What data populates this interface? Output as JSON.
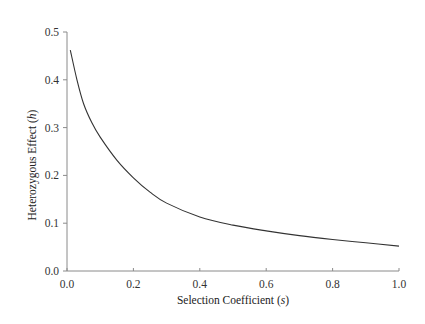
{
  "chart_data": {
    "type": "line",
    "title": "",
    "xlabel": "Selection Coefficient (s)",
    "xlabel_parts": {
      "main": "Selection Coefficient (",
      "var": "s",
      "end": ")"
    },
    "ylabel": "Heterozygous Effect (h)",
    "ylabel_parts": {
      "main": "Heterozygous Effect (",
      "var": "h",
      "end": ")"
    },
    "xlim": [
      0.0,
      1.0
    ],
    "ylim": [
      0.0,
      0.5
    ],
    "xticks": [
      "0.0",
      "0.2",
      "0.4",
      "0.6",
      "0.8",
      "1.0"
    ],
    "yticks": [
      "0.0",
      "0.1",
      "0.2",
      "0.3",
      "0.4",
      "0.5"
    ],
    "grid": false,
    "legend": null,
    "series": [
      {
        "name": "h(s)",
        "color": "#333333",
        "x": [
          0.01,
          0.03,
          0.05,
          0.075,
          0.1,
          0.15,
          0.2,
          0.25,
          0.3,
          0.4,
          0.5,
          0.6,
          0.7,
          0.8,
          0.9,
          1.0
        ],
        "y": [
          0.462,
          0.4,
          0.35,
          0.31,
          0.28,
          0.232,
          0.195,
          0.165,
          0.142,
          0.113,
          0.096,
          0.084,
          0.074,
          0.066,
          0.059,
          0.052
        ]
      }
    ]
  }
}
